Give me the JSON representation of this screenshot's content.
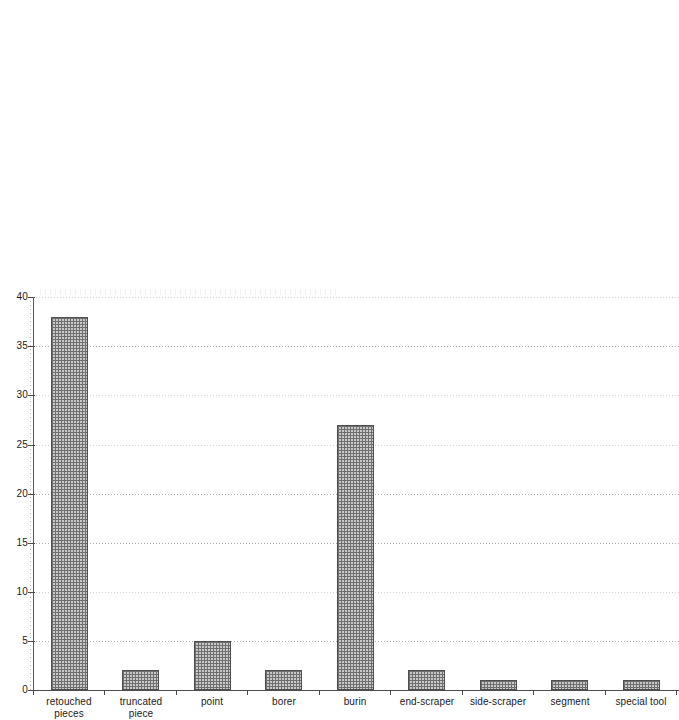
{
  "chart_data": {
    "type": "bar",
    "title": "",
    "subtitle": "",
    "xlabel": "",
    "ylabel": "",
    "categories": [
      "retouched pieces",
      "truncated piece",
      "point",
      "borer",
      "burin",
      "end-scraper",
      "side-scraper",
      "segment",
      "special tool"
    ],
    "category_lines": [
      [
        "retouched",
        "pieces"
      ],
      [
        "truncated",
        "piece"
      ],
      [
        "point",
        ""
      ],
      [
        "borer",
        ""
      ],
      [
        "burin",
        ""
      ],
      [
        "end-scraper",
        ""
      ],
      [
        "side-scraper",
        ""
      ],
      [
        "segment",
        ""
      ],
      [
        "special tool",
        ""
      ]
    ],
    "values": [
      12,
      38,
      2,
      5,
      2,
      27,
      2,
      1,
      1
    ],
    "ylim": [
      0,
      40
    ],
    "ytick_labels": [
      "0",
      "5",
      "10",
      "15",
      "20",
      "25",
      "30",
      "35",
      "40"
    ],
    "ytick_values": [
      0,
      5,
      10,
      15,
      20,
      25,
      30,
      35,
      40
    ],
    "grid": "horizontal-dotted",
    "legend": "none",
    "bar_fill_color": "#c9c9c9",
    "bar_edge_color": "#4f4f4f",
    "axis_color": "#4a4a4a",
    "gridline_color": "#9a9a9a",
    "text_color": "#1a1a1a",
    "background_color": "#ffffff"
  }
}
